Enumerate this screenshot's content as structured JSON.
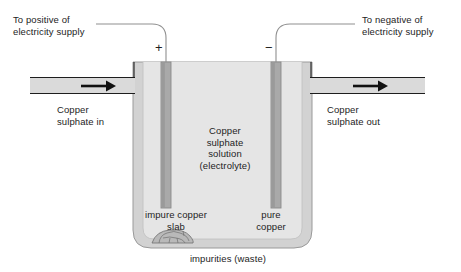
{
  "diagram": {
    "labels": {
      "positive_lead": "To positive of\nelectricity supply",
      "negative_lead": "To negative of\nelectricity supply",
      "inlet": "Copper\nsulphate in",
      "outlet": "Copper\nsulphate out",
      "electrolyte": "Copper\nsulphate\nsolution\n(electrolyte)",
      "anode": "impure copper\nslab",
      "cathode": "pure\ncopper",
      "sediment": "impurities (waste)",
      "plus_sign": "+",
      "minus_sign": "−"
    },
    "colors": {
      "stroke": "#1d1d1d",
      "wire": "#8d8d8d",
      "tank_wall": "#cfcfcf",
      "solution": "#e3e3e3",
      "electrode": "#a8a8a8",
      "electrode_edge": "#8a8a8a",
      "pipe_fill": "#d9d9d9",
      "sediment": "#b6b6b6",
      "background": "#ffffff"
    },
    "elements": {
      "anode_name": "impure copper slab",
      "cathode_name": "pure copper",
      "tank_name": "electrolysis tank"
    }
  }
}
